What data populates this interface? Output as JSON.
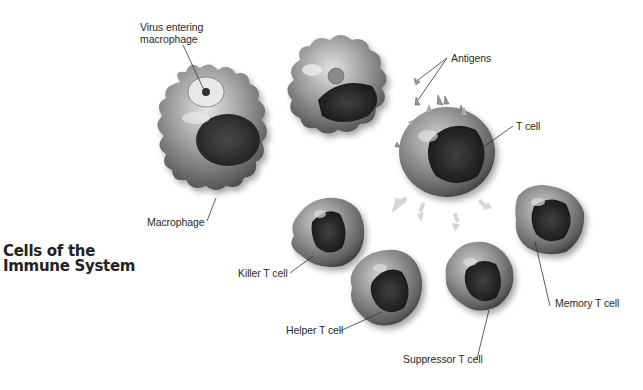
{
  "title": {
    "line1": "Cells of the",
    "line2": "Immune System"
  },
  "labels": {
    "virus_entering": [
      "Virus entering",
      "macrophage"
    ],
    "antigens": "Antigens",
    "t_cell": "T cell",
    "macrophage": "Macrophage",
    "killer_t_cell": "Killer T cell",
    "helper_t_cell": "Helper T cell",
    "suppressor_t_cell": "Suppressor T cell",
    "memory_t_cell": "Memory T cell"
  },
  "colors": {
    "background": "#ffffff",
    "text": "#2a2a2a",
    "leader_line": "#333333",
    "arrow": "#d6d6d6",
    "cell_membrane": "#8a8a8a",
    "nucleus": "#2b2b2b"
  }
}
